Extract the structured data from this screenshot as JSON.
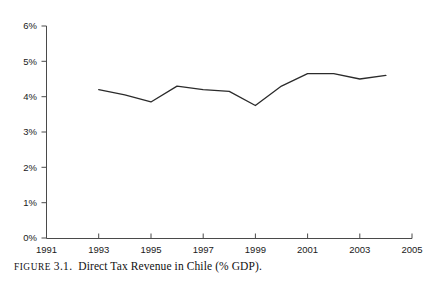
{
  "caption": {
    "prefix": "FIGURE",
    "number": "3.1.",
    "text": "Direct Tax Revenue in Chile (% GDP)."
  },
  "chart_data": {
    "type": "line",
    "title": "Direct Tax Revenue in Chile (% GDP)",
    "xlabel": "",
    "ylabel": "",
    "x": [
      1993,
      1994,
      1995,
      1996,
      1997,
      1998,
      1999,
      2000,
      2001,
      2002,
      2003,
      2004
    ],
    "values": [
      4.2,
      4.05,
      3.85,
      4.3,
      4.2,
      4.15,
      3.75,
      4.3,
      4.65,
      4.65,
      4.5,
      4.6
    ],
    "series": [
      {
        "name": "Direct Tax Revenue (% GDP)",
        "values": [
          4.2,
          4.05,
          3.85,
          4.3,
          4.2,
          4.15,
          3.75,
          4.3,
          4.65,
          4.65,
          4.5,
          4.6
        ]
      }
    ],
    "xlim": [
      1991,
      2005
    ],
    "ylim": [
      0,
      6
    ],
    "ytick_labels": [
      "0%",
      "1%",
      "2%",
      "3%",
      "4%",
      "5%",
      "6%"
    ],
    "ytick_values": [
      0,
      1,
      2,
      3,
      4,
      5,
      6
    ],
    "xtick_labels": [
      "1991",
      "1993",
      "1995",
      "1997",
      "1999",
      "2001",
      "2003",
      "2005"
    ],
    "xtick_values": [
      1991,
      1993,
      1995,
      1997,
      1999,
      2001,
      2003,
      2005
    ],
    "grid": false,
    "legend": "none",
    "line_color": "#2b2b2b",
    "axis_color": "#4a4a4a"
  }
}
